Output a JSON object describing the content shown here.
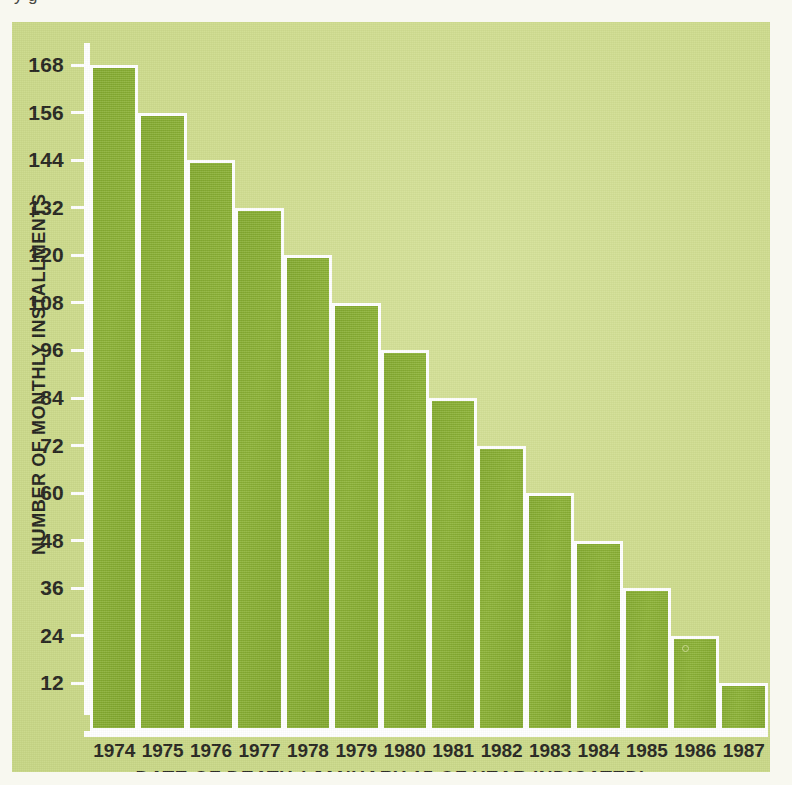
{
  "clipped_title": "y              g",
  "colors": {
    "bar": "#84ab2e",
    "plot_background": "#cfdc8e",
    "page_background": "#f8f8f0",
    "axis": "#ffffff",
    "text": "#26261f"
  },
  "chart_data": {
    "type": "bar",
    "title": "",
    "xlabel": "DATE OF DEATH ( JANUARY 15 OF YEAR INDICATED)",
    "ylabel": "NUMBER OF MONTHLY INSTALLMENTS",
    "categories": [
      "1974",
      "1975",
      "1976",
      "1977",
      "1978",
      "1979",
      "1980",
      "1981",
      "1982",
      "1983",
      "1984",
      "1985",
      "1986",
      "1987"
    ],
    "values": [
      168,
      156,
      144,
      132,
      120,
      108,
      96,
      84,
      72,
      60,
      48,
      36,
      24,
      12
    ],
    "ylim": [
      0,
      168
    ],
    "ytick_labels": [
      "168",
      "156",
      "144",
      "132",
      "120",
      "108",
      "96",
      "84",
      "72",
      "60",
      "48",
      "36",
      "24",
      "12"
    ],
    "ytick_values": [
      168,
      156,
      144,
      132,
      120,
      108,
      96,
      84,
      72,
      60,
      48,
      36,
      24,
      12
    ],
    "grid": false,
    "legend": null
  }
}
